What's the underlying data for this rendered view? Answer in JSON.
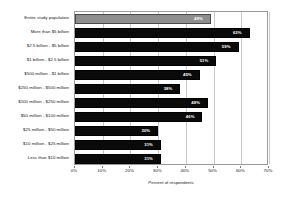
{
  "chart_data": {
    "type": "bar",
    "orientation": "horizontal",
    "title": "",
    "xlabel": "Percent of respondents",
    "ylabel": "",
    "xlim": [
      0,
      70
    ],
    "xticks": [
      "0%",
      "10%",
      "20%",
      "30%",
      "40%",
      "50%",
      "60%",
      "70%"
    ],
    "xtick_values": [
      0,
      10,
      20,
      30,
      40,
      50,
      60,
      70
    ],
    "grid": "vertical",
    "legend": "none",
    "categories": [
      "Entire study population",
      "More than $5 billion",
      "$2.5 billion - $5 billion",
      "$1 billion - $2.5 billion",
      "$500 million - $1 billion",
      "$250 million - $500 million",
      "$100 million - $250 million",
      "$50 million - $100 million",
      "$25 million - $50 million",
      "$10 million - $25 million",
      "Less than $10 million"
    ],
    "values": [
      49,
      63,
      59,
      51,
      45,
      38,
      48,
      46,
      30,
      31,
      31
    ],
    "value_labels": [
      "49%",
      "63%",
      "59%",
      "51%",
      "45%",
      "38%",
      "48%",
      "46%",
      "30%",
      "31%",
      "31%"
    ],
    "bar_colors": [
      "#8e8e8e",
      "#0a0a0a",
      "#0a0a0a",
      "#0a0a0a",
      "#0a0a0a",
      "#0a0a0a",
      "#0a0a0a",
      "#0a0a0a",
      "#0a0a0a",
      "#0a0a0a",
      "#0a0a0a"
    ],
    "highlight_index": 0,
    "colors": {
      "highlight_bar": "#8e8e8e",
      "bar": "#0a0a0a",
      "gridline": "#c9c9c9",
      "plot_border": "#9a9a9a",
      "background": "#ffffff",
      "text": "#1a1a1a",
      "value_label_text": "#ffffff"
    }
  }
}
